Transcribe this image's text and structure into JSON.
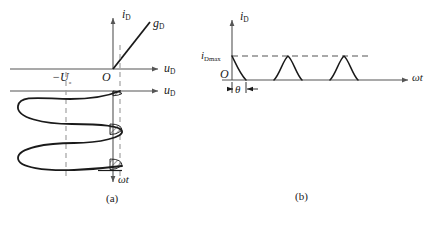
{
  "figure": {
    "background": "#ffffff",
    "line_color": "#1a1a1a",
    "axis_color": "#555555",
    "dash_color": "#999999",
    "hatch_color": "#444444",
    "width": 433,
    "height": 226
  },
  "panel_a": {
    "caption": "(a)",
    "labels": {
      "i_axis": {
        "base": "i",
        "sub": "D"
      },
      "u_axis_top": {
        "base": "u",
        "sub": "D"
      },
      "u_axis_lower": {
        "base": "u",
        "sub": "D"
      },
      "origin": "O",
      "slope": {
        "base": "g",
        "sub": "D"
      },
      "bias": {
        "base": "−U",
        "sub": "₀"
      },
      "omega_t": "ωt"
    },
    "geometry": {
      "origin_x": 113,
      "top_axis_y": 69,
      "lower_axis_y": 91,
      "i_axis_top_y": 14,
      "u_axis_right_x": 163,
      "omega_axis_bottom_y": 185,
      "cutin_dash_x": 120,
      "bias_dash_x": 66,
      "dash_top_y": 45,
      "dash_bottom_y": 180,
      "sine_left_x": 18,
      "sine_right_x": 122,
      "wave_start_y": 91,
      "wave_end_y": 178,
      "cycles": 2.5
    },
    "hatched_regions": 3
  },
  "panel_b": {
    "caption": "(b)",
    "labels": {
      "i_axis": {
        "base": "i",
        "sub": "D"
      },
      "peak": {
        "base": "i",
        "sub": "Dmax"
      },
      "origin": "O",
      "omega_t": "ωt",
      "angle": "θ"
    },
    "geometry": {
      "origin_x": 232,
      "baseline_y": 80,
      "i_axis_top_y": 16,
      "peak_y": 56,
      "omega_axis_right_x": 412,
      "pulse_half_width": 14,
      "period": 56,
      "theta_dim_y": 89
    },
    "pulses": [
      {
        "center_x": 232,
        "clipped_left": true
      },
      {
        "center_x": 288,
        "clipped_left": false
      },
      {
        "center_x": 344,
        "clipped_left": false
      }
    ]
  }
}
